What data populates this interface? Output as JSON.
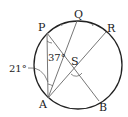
{
  "diagram": {
    "type": "circle-geometry",
    "points": {
      "P": {
        "label": "P"
      },
      "Q": {
        "label": "Q"
      },
      "R": {
        "label": "R"
      },
      "A": {
        "label": "A"
      },
      "B": {
        "label": "B"
      },
      "S": {
        "label": "S"
      }
    },
    "angles": {
      "PAS_label": "37°",
      "left_label": "21°"
    },
    "segments": [
      "AP",
      "AQ",
      "AR",
      "PB"
    ],
    "colors": {
      "circle": "#222222",
      "chords": "#777777",
      "text": "#222222"
    }
  }
}
